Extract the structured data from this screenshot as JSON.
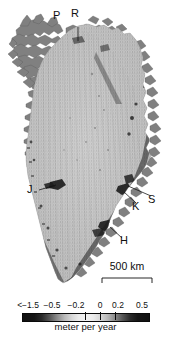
{
  "figure": {
    "kind": "greenland-ice-sheet-elevation-change-map",
    "background_color": "#ffffff",
    "ink_color": "#101010"
  },
  "map": {
    "region_name": "Greenland",
    "ice_fill_color": "#b9b9b9",
    "rock_color": "#6e6e6e",
    "ocean_color": "#ffffff",
    "labels": [
      {
        "id": "P",
        "text": "P",
        "x": 57,
        "y": 16,
        "leader": null
      },
      {
        "id": "R",
        "text": "R",
        "x": 75,
        "y": 14,
        "leader": {
          "x1": 78,
          "y1": 27,
          "x2": 78,
          "y2": 41
        }
      },
      {
        "id": "J",
        "text": "J",
        "x": 31,
        "y": 190,
        "leader": {
          "x1": 39,
          "y1": 190,
          "x2": 56,
          "y2": 185
        }
      },
      {
        "id": "K",
        "text": "K",
        "x": 136,
        "y": 207,
        "leader": {
          "x1": 136,
          "y1": 203,
          "x2": 124,
          "y2": 192
        }
      },
      {
        "id": "S",
        "text": "S",
        "x": 152,
        "y": 200,
        "leader": {
          "x1": 151,
          "y1": 196,
          "x2": 128,
          "y2": 186
        }
      },
      {
        "id": "H",
        "text": "H",
        "x": 124,
        "y": 241,
        "leader": {
          "x1": 122,
          "y1": 238,
          "x2": 110,
          "y2": 227
        }
      }
    ]
  },
  "scalebar": {
    "label": "500 km",
    "left_px": 102,
    "right_px": 152,
    "baseline_y": 278,
    "tick_height": 5
  },
  "chart_data": {
    "type": "heatmap",
    "title": "",
    "xlabel": "",
    "ylabel": "",
    "colorbar": {
      "unit_label": "meter per year",
      "tick_labels": [
        "<−1.5",
        "−0.5",
        "−0.2",
        "0",
        "0.2",
        "0.5"
      ],
      "tick_values": [
        -1.5,
        -0.5,
        -0.2,
        0,
        0.2,
        0.5
      ],
      "tick_positions_px": [
        28,
        52,
        76,
        100,
        118,
        142
      ],
      "major_tick_marks_px": [
        85,
        100,
        115
      ],
      "bar_left_px": 22,
      "bar_right_px": 148,
      "colormap": "grayscale-diverging-dark-light-dark",
      "range_min": -1.5,
      "range_max": 0.65,
      "center": 0
    },
    "legend_position": "bottom",
    "grid": false,
    "annotations": [
      "P",
      "R",
      "J",
      "K",
      "S",
      "H",
      "500 km"
    ]
  }
}
